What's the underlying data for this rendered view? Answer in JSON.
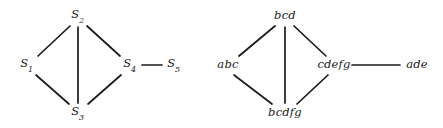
{
  "figure": {
    "background_color": "#ffffff",
    "edge_color": "#1a1a1a",
    "label_color": "#1a1a1a",
    "width": 443,
    "height": 128
  },
  "graphs": [
    {
      "id": "left-graph",
      "name": "graph-s",
      "nodes": [
        {
          "id": "s2",
          "label": "S2",
          "base": "S",
          "subscript": "2",
          "x": 78,
          "y": 16
        },
        {
          "id": "s1",
          "label": "S1",
          "base": "S",
          "subscript": "1",
          "x": 27,
          "y": 65
        },
        {
          "id": "s4",
          "label": "S4",
          "base": "S",
          "subscript": "4",
          "x": 130,
          "y": 65
        },
        {
          "id": "s5",
          "label": "S5",
          "base": "S",
          "subscript": "5",
          "x": 174,
          "y": 65
        },
        {
          "id": "s3",
          "label": "S3",
          "base": "S",
          "subscript": "3",
          "x": 78,
          "y": 113
        }
      ],
      "edges": [
        {
          "from": "s1",
          "to": "s2",
          "x1": 38,
          "y1": 56,
          "x2": 70,
          "y2": 26
        },
        {
          "from": "s2",
          "to": "s4",
          "x1": 87,
          "y1": 26,
          "x2": 120,
          "y2": 56
        },
        {
          "from": "s2",
          "to": "s3",
          "x1": 78,
          "y1": 27,
          "x2": 78,
          "y2": 103
        },
        {
          "from": "s1",
          "to": "s3",
          "x1": 36,
          "y1": 75,
          "x2": 69,
          "y2": 104
        },
        {
          "from": "s3",
          "to": "s4",
          "x1": 88,
          "y1": 104,
          "x2": 121,
          "y2": 75
        },
        {
          "from": "s4",
          "to": "s5",
          "x1": 142,
          "y1": 65,
          "x2": 162,
          "y2": 65
        }
      ]
    },
    {
      "id": "right-graph",
      "name": "graph-sets",
      "nodes": [
        {
          "id": "bcd",
          "label": "bcd",
          "x": 285,
          "y": 16
        },
        {
          "id": "abc",
          "label": "abc",
          "x": 228,
          "y": 65
        },
        {
          "id": "cdefg",
          "label": "cdefg",
          "x": 334,
          "y": 65
        },
        {
          "id": "ade",
          "label": "ade",
          "x": 417,
          "y": 65
        },
        {
          "id": "bcdfg",
          "label": "bcdfg",
          "x": 285,
          "y": 113
        }
      ],
      "edges": [
        {
          "from": "abc",
          "to": "bcd",
          "x1": 239,
          "y1": 56,
          "x2": 275,
          "y2": 26
        },
        {
          "from": "bcd",
          "to": "cdefg",
          "x1": 294,
          "y1": 26,
          "x2": 326,
          "y2": 56
        },
        {
          "from": "bcd",
          "to": "bcdfg",
          "x1": 285,
          "y1": 27,
          "x2": 285,
          "y2": 103
        },
        {
          "from": "abc",
          "to": "bcdfg",
          "x1": 234,
          "y1": 75,
          "x2": 272,
          "y2": 104
        },
        {
          "from": "bcdfg",
          "to": "cdefg",
          "x1": 297,
          "y1": 104,
          "x2": 328,
          "y2": 75
        },
        {
          "from": "cdefg",
          "to": "ade",
          "x1": 352,
          "y1": 65,
          "x2": 400,
          "y2": 65
        }
      ]
    }
  ]
}
